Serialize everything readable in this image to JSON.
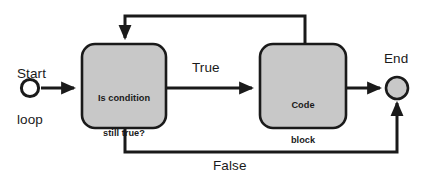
{
  "diagram": {
    "type": "flowchart",
    "width": 434,
    "height": 183,
    "colors": {
      "background": "#ffffff",
      "node_fill": "#c8c8c8",
      "node_stroke": "#1a1a1a",
      "start_fill": "#ffffff",
      "end_fill": "#c8c8c8",
      "line": "#1a1a1a",
      "text": "#1a1a1a"
    },
    "nodes": [
      {
        "id": "start",
        "shape": "circle",
        "label": "Start\nloop",
        "label_lines": [
          "Start",
          "loop"
        ],
        "label_position": "above",
        "fill": "#ffffff",
        "cx": 30,
        "cy": 88,
        "r": 9
      },
      {
        "id": "decision",
        "shape": "rounded-rect",
        "label_lines": [
          "Is condition",
          "still true?"
        ],
        "label": "Is condition still true?",
        "fill": "#c8c8c8",
        "x": 82,
        "y": 44,
        "width": 84,
        "height": 84
      },
      {
        "id": "process",
        "shape": "rounded-rect",
        "label_lines": [
          "Code",
          "block"
        ],
        "label": "Code block",
        "fill": "#c8c8c8",
        "x": 260,
        "y": 44,
        "width": 86,
        "height": 84
      },
      {
        "id": "end",
        "shape": "circle",
        "label": "End",
        "label_position": "above",
        "fill": "#c8c8c8",
        "cx": 397,
        "cy": 88,
        "r": 11
      }
    ],
    "edges": [
      {
        "id": "start-to-decision",
        "from": "start",
        "to": "decision",
        "label": "",
        "arrowhead": true,
        "path": "M 41 88 L 76 88"
      },
      {
        "id": "decision-to-process",
        "from": "decision",
        "to": "process",
        "label": "True",
        "arrowhead": true,
        "path": "M 166 88 L 254 88"
      },
      {
        "id": "process-to-end",
        "from": "process",
        "to": "end",
        "label": "",
        "arrowhead": true,
        "path": "M 346 88 L 382 88"
      },
      {
        "id": "process-loopback-to-decision",
        "from": "process",
        "to": "decision",
        "label": "",
        "arrowhead": true,
        "path": "M 305 44 L 305 16 L 125 16 L 125 38"
      },
      {
        "id": "decision-false-to-end",
        "from": "decision",
        "to": "end",
        "label": "False",
        "arrowhead": true,
        "path": "M 125 128 L 125 152 L 397 152 L 397 103"
      }
    ],
    "labels": {
      "start": "Start\nloop",
      "start_line1": "Start",
      "start_line2": "loop",
      "decision_line1": "Is condition",
      "decision_line2": "still true?",
      "true_branch": "True",
      "false_branch": "False",
      "process_line1": "Code",
      "process_line2": "block",
      "end": "End"
    }
  }
}
